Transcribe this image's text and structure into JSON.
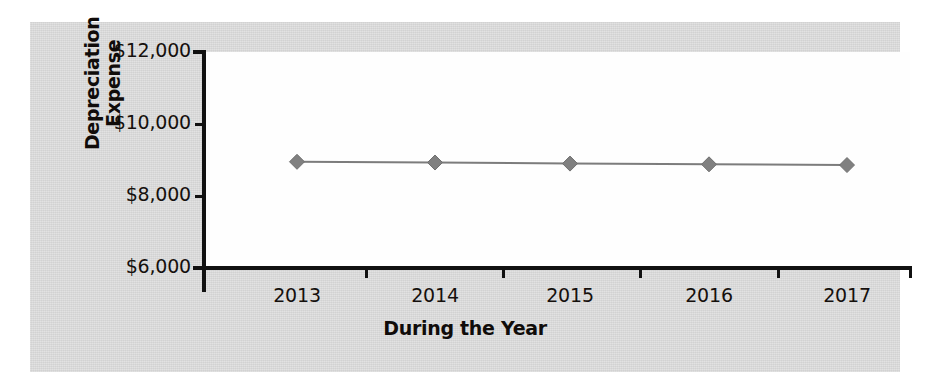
{
  "chart_data": {
    "type": "line",
    "title": "",
    "xlabel": "During the Year",
    "ylabel": "Depreciation Expense",
    "categories": [
      "2013",
      "2014",
      "2015",
      "2016",
      "2017"
    ],
    "values": [
      8950,
      8930,
      8900,
      8880,
      8860
    ],
    "series": [
      {
        "name": "Depreciation Expense",
        "values": [
          8950,
          8930,
          8900,
          8880,
          8860
        ],
        "line_color": "#7c7c7c",
        "marker_color": "#808080",
        "marker": "diamond"
      }
    ],
    "ylim": [
      6000,
      12000
    ],
    "ytick_values": [
      6000,
      8000,
      10000,
      12000
    ],
    "ytick_labels": [
      "$6,000",
      "$8,000",
      "$10,000",
      "$12,000"
    ],
    "xtick_labels": [
      "2013",
      "2014",
      "2015",
      "2016",
      "2017"
    ],
    "grid": false,
    "legend": false,
    "legend_position": "none",
    "plot_background": "#fefefe",
    "panel_background": "#d6d6d6",
    "axis_color": "#111111"
  }
}
